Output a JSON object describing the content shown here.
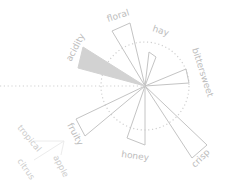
{
  "chart_data": {
    "type": "radial-bar",
    "title": "",
    "center": [
      145,
      86
    ],
    "guide_circle_radius": 44,
    "guide_line": {
      "from": [
        0,
        86
      ],
      "to": [
        145,
        86
      ]
    },
    "categories": [
      "floral",
      "hay",
      "bittersweet",
      "crisp",
      "honey",
      "fruity",
      "acidity"
    ],
    "series": [
      {
        "name": "flavor intensity",
        "values": [
          65,
          33,
          44,
          86,
          57,
          77,
          71
        ]
      }
    ],
    "highlighted": "acidity",
    "sub_categories": {
      "fruity": [
        "tropical",
        "citrus",
        "apple"
      ]
    },
    "wedges": [
      {
        "label": "floral",
        "points": "145,86 112,31 130,23",
        "highlight": false
      },
      {
        "label": "hay",
        "points": "145,86 149,52 156,57",
        "highlight": false
      },
      {
        "label": "bittersweet",
        "points": "145,86 186,69 189,83",
        "highlight": false
      },
      {
        "label": "crisp",
        "points": "145,86 207,145 192,158",
        "highlight": false
      },
      {
        "label": "honey",
        "points": "145,86 127,138 145,145",
        "highlight": false
      },
      {
        "label": "fruity",
        "points": "145,86 76,119 85,136",
        "highlight": false
      },
      {
        "label": "acidity",
        "points": "145,86 83,47 78,68",
        "highlight": true
      }
    ],
    "labels": [
      {
        "text": "floral",
        "x": 108,
        "y": 22,
        "rotate": -18
      },
      {
        "text": "hay",
        "x": 152,
        "y": 31,
        "rotate": 18
      },
      {
        "text": "bittersweet",
        "x": 192,
        "y": 49,
        "rotate": 72
      },
      {
        "text": "crisp",
        "x": 195,
        "y": 168,
        "rotate": -45
      },
      {
        "text": "honey",
        "x": 121,
        "y": 157,
        "rotate": 8
      },
      {
        "text": "fruity",
        "x": 67,
        "y": 125,
        "rotate": 62
      },
      {
        "text": "acidity",
        "x": 71,
        "y": 62,
        "rotate": -62
      }
    ],
    "sub_labels": [
      {
        "text": "tropical",
        "x": 17,
        "y": 128,
        "rotate": 50
      },
      {
        "text": "citrus",
        "x": 17,
        "y": 161,
        "rotate": 55
      },
      {
        "text": "apple",
        "x": 53,
        "y": 157,
        "rotate": 62
      }
    ],
    "sub_lines": [
      {
        "from": [
          64,
          141
        ],
        "to": [
          33,
          141
        ]
      },
      {
        "from": [
          64,
          141
        ],
        "to": [
          34,
          160
        ]
      },
      {
        "from": [
          64,
          141
        ],
        "to": [
          61,
          155
        ]
      }
    ]
  }
}
